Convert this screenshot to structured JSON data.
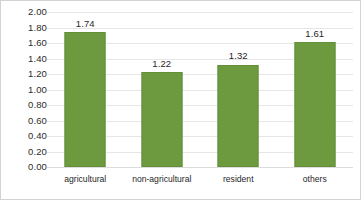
{
  "chart_data": {
    "type": "bar",
    "title": "",
    "subtitle": "",
    "xlabel": "",
    "ylabel": "",
    "categories": [
      "agricultural",
      "non-agricultural",
      "resident",
      "others"
    ],
    "values": [
      1.74,
      1.22,
      1.32,
      1.61
    ],
    "value_labels": [
      "1.74",
      "1.22",
      "1.32",
      "1.61"
    ],
    "ylim": [
      0.0,
      2.0
    ],
    "ytick_step": 0.2,
    "ytick_labels": [
      "2.00",
      "1.80",
      "1.60",
      "1.40",
      "1.20",
      "1.00",
      "0.80",
      "0.60",
      "0.40",
      "0.20",
      "0.00"
    ],
    "ytick_values": [
      2.0,
      1.8,
      1.6,
      1.4,
      1.2,
      1.0,
      0.8,
      0.6,
      0.4,
      0.2,
      0.0
    ],
    "grid": "horizontal",
    "legend": "none",
    "data_labels": true,
    "series": [
      {
        "name": "",
        "values": [
          1.74,
          1.22,
          1.32,
          1.61
        ]
      }
    ]
  },
  "colors": {
    "bar_fill": "#6d9a3f",
    "bar_edge": "#648f39",
    "gridline": "#e6e6e6",
    "baseline": "#dcdcdc",
    "text": "#1f1f1f",
    "tick_text": "#2b2b2b",
    "figure_border": "#d3d3d3",
    "background": "#ffffff"
  }
}
